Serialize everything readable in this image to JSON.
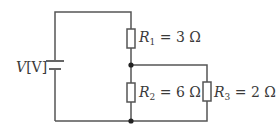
{
  "diagram": {
    "type": "circuit",
    "source": {
      "label": "V[V]",
      "symbol": "V",
      "unit": "[V]"
    },
    "resistors": [
      {
        "name": "R",
        "sub": "1",
        "value": "= 3 Ω",
        "connection": "series"
      },
      {
        "name": "R",
        "sub": "2",
        "value": "= 6 Ω",
        "connection": "parallel with R3"
      },
      {
        "name": "R",
        "sub": "3",
        "value": "= 2 Ω",
        "connection": "parallel with R2"
      }
    ],
    "colors": {
      "wire": "#555555",
      "text": "#3a3a3a",
      "background": "#ffffff"
    }
  }
}
